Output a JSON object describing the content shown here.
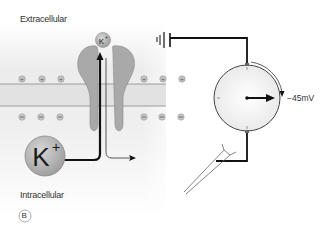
{
  "figure": {
    "panel_label": "B",
    "regions": {
      "top": "Extracellular",
      "bottom": "Intracellular"
    },
    "ions": {
      "small_ion": {
        "symbol": "K",
        "charge": "+"
      },
      "large_ion": {
        "symbol": "K",
        "charge": "+"
      },
      "outer_charge": "+",
      "inner_charge": "−",
      "outer_charge_count": 6,
      "inner_charge_count": 6
    },
    "meter": {
      "reading": "−45mV"
    },
    "colors": {
      "background_panel": "#e9e9e9",
      "membrane": "#dcdcdc",
      "membrane_lines": "#8c8c8c",
      "channel_protein": "#a9a9a9",
      "ion_fill": "#b5b5b5",
      "wire": "#1a1a1a",
      "meter_face": "#f7f7f7"
    }
  }
}
